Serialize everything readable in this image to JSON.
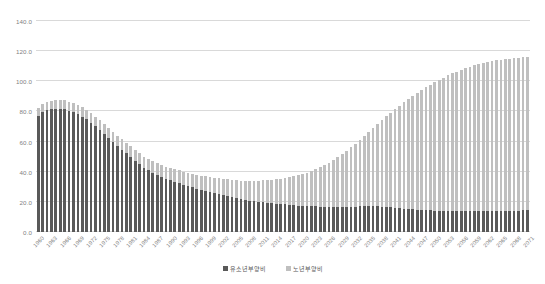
{
  "chart_data": {
    "type": "bar",
    "subtype": "stacked-column",
    "title": "",
    "xlabel": "",
    "ylabel": "",
    "ylim": [
      0.0,
      140.0
    ],
    "yticks": [
      "0.0",
      "20.0",
      "40.0",
      "60.0",
      "80.0",
      "100.0",
      "120.0",
      "140.0"
    ],
    "ytick_values": [
      0,
      20,
      40,
      60,
      80,
      100,
      120,
      140
    ],
    "grid": true,
    "legend_position": "bottom-center",
    "xtick_step": 3,
    "colors": {
      "youth": "#595959",
      "old": "#bfbfbf",
      "gridline": "#d9d9d9",
      "tick_text": "#7f7f7f",
      "legend_text": "#595959",
      "background": "#ffffff"
    },
    "legend": [
      {
        "name": "유소년부양비",
        "color": "#595959"
      },
      {
        "name": "노년부양비",
        "color": "#bfbfbf"
      }
    ],
    "series": [
      {
        "name": "유소년부양비",
        "color": "#595959",
        "values": [
          77.3,
          79.4,
          80.8,
          81.4,
          81.6,
          81.7,
          81.4,
          80.6,
          79.5,
          78.2,
          76.6,
          74.7,
          72.5,
          70.1,
          67.6,
          65.0,
          62.3,
          59.6,
          57.0,
          54.5,
          52.1,
          49.7,
          47.3,
          45.0,
          42.8,
          41.0,
          39.4,
          38.0,
          36.7,
          35.5,
          34.4,
          33.4,
          32.4,
          31.4,
          30.5,
          29.6,
          28.8,
          28.0,
          27.3,
          26.6,
          25.9,
          25.2,
          24.5,
          23.8,
          23.1,
          22.4,
          21.8,
          21.2,
          20.7,
          20.3,
          19.9,
          19.6,
          19.3,
          19.1,
          18.9,
          18.6,
          18.3,
          18.0,
          17.7,
          17.5,
          17.3,
          17.2,
          17.1,
          17.0,
          16.9,
          16.8,
          16.7,
          16.6,
          16.6,
          16.6,
          16.7,
          16.8,
          16.9,
          17.0,
          17.1,
          17.1,
          17.1,
          17.0,
          16.9,
          16.7,
          16.5,
          16.2,
          15.9,
          15.6,
          15.3,
          15.0,
          14.8,
          14.6,
          14.4,
          14.3,
          14.2,
          14.1,
          14.0,
          13.9,
          13.9,
          13.8,
          13.8,
          13.8,
          13.8,
          13.8,
          13.8,
          13.8,
          13.9,
          13.9,
          14.0,
          14.0,
          14.1,
          14.1,
          14.2,
          14.2,
          14.3,
          14.3
        ]
      },
      {
        "name": "노년부양비",
        "color": "#bfbfbf",
        "values": [
          5.3,
          5.4,
          5.5,
          5.6,
          5.7,
          5.8,
          5.9,
          6.0,
          6.1,
          6.2,
          6.3,
          6.4,
          6.4,
          6.5,
          6.5,
          6.6,
          6.7,
          6.8,
          6.8,
          6.9,
          7.0,
          7.1,
          7.2,
          7.2,
          7.3,
          7.4,
          7.5,
          7.6,
          7.8,
          7.9,
          8.1,
          8.3,
          8.5,
          8.7,
          8.9,
          9.1,
          9.3,
          9.5,
          9.8,
          10.0,
          10.2,
          10.5,
          10.8,
          11.1,
          11.4,
          11.8,
          12.2,
          12.6,
          13.1,
          13.6,
          14.1,
          14.6,
          15.1,
          15.6,
          16.2,
          16.8,
          17.5,
          18.3,
          19.2,
          20.1,
          21.1,
          22.2,
          23.4,
          24.7,
          26.1,
          27.6,
          29.3,
          31.1,
          33.0,
          35.0,
          37.1,
          39.4,
          41.8,
          44.3,
          46.8,
          49.4,
          52.0,
          54.7,
          57.4,
          60.1,
          62.8,
          65.4,
          68.0,
          70.5,
          72.9,
          75.2,
          77.4,
          79.5,
          81.5,
          83.4,
          85.2,
          86.9,
          88.5,
          90.0,
          91.4,
          92.7,
          93.9,
          95.0,
          96.0,
          96.9,
          97.7,
          98.4,
          99.0,
          99.5,
          99.9,
          100.3,
          100.6,
          100.9,
          101.2,
          101.4,
          101.6,
          101.8
        ]
      }
    ],
    "categories": [
      "1960",
      "1961",
      "1962",
      "1963",
      "1964",
      "1965",
      "1966",
      "1967",
      "1968",
      "1969",
      "1970",
      "1971",
      "1972",
      "1973",
      "1974",
      "1975",
      "1976",
      "1977",
      "1978",
      "1979",
      "1980",
      "1981",
      "1982",
      "1983",
      "1984",
      "1985",
      "1986",
      "1987",
      "1988",
      "1989",
      "1990",
      "1991",
      "1992",
      "1993",
      "1994",
      "1995",
      "1996",
      "1997",
      "1998",
      "1999",
      "2000",
      "2001",
      "2002",
      "2003",
      "2004",
      "2005",
      "2006",
      "2007",
      "2008",
      "2009",
      "2010",
      "2011",
      "2012",
      "2013",
      "2014",
      "2015",
      "2016",
      "2017",
      "2018",
      "2019",
      "2020",
      "2021",
      "2022",
      "2023",
      "2024",
      "2025",
      "2026",
      "2027",
      "2028",
      "2029",
      "2030",
      "2031",
      "2032",
      "2033",
      "2034",
      "2035",
      "2036",
      "2037",
      "2038",
      "2039",
      "2040",
      "2041",
      "2042",
      "2043",
      "2044",
      "2045",
      "2046",
      "2047",
      "2048",
      "2049",
      "2050",
      "2051",
      "2052",
      "2053",
      "2054",
      "2055",
      "2056",
      "2057",
      "2058",
      "2059",
      "2060",
      "2061",
      "2062",
      "2063",
      "2064",
      "2065",
      "2066",
      "2067",
      "2068",
      "2069",
      "2070",
      "2071"
    ],
    "visible_xtick_labels": [
      "1960",
      "1963",
      "1966",
      "1969",
      "1972",
      "1975",
      "1978",
      "1981",
      "1984",
      "1987",
      "1990",
      "1993",
      "1996",
      "1999",
      "2002",
      "2005",
      "2008",
      "2011",
      "2014",
      "2017",
      "2020",
      "2023",
      "2026",
      "2029",
      "2032",
      "2035",
      "2038",
      "2041",
      "2044",
      "2047",
      "2050",
      "2053",
      "2056",
      "2059",
      "2062",
      "2065",
      "2068",
      "2071"
    ]
  }
}
